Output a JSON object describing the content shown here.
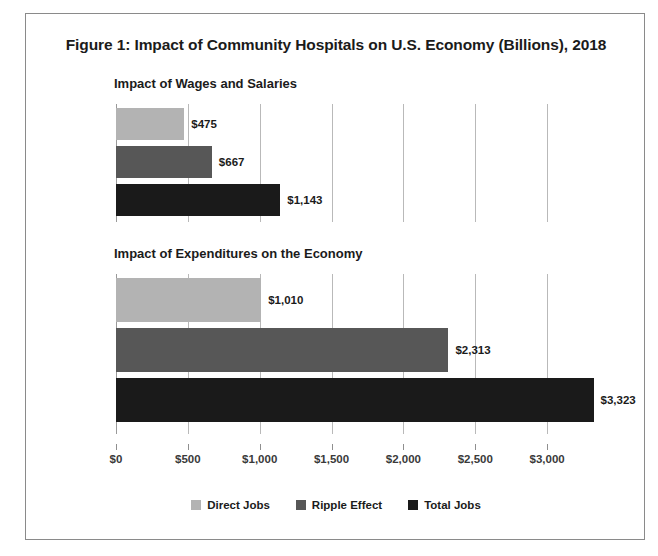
{
  "figure": {
    "title": "Figure 1: Impact of Community Hospitals on U.S. Economy (Billions), 2018"
  },
  "legend": {
    "items": [
      {
        "label": "Direct Jobs",
        "color": "#b3b3b3"
      },
      {
        "label": "Ripple Effect",
        "color": "#575757"
      },
      {
        "label": "Total Jobs",
        "color": "#1a1a1a"
      }
    ]
  },
  "axis": {
    "tick_labels": [
      "$0",
      "$500",
      "$1,000",
      "$1,500",
      "$2,000",
      "$2,500",
      "$3,000"
    ],
    "tick_values": [
      0,
      500,
      1000,
      1500,
      2000,
      2500,
      3000
    ]
  },
  "panels": [
    {
      "subtitle": "Impact of Wages and Salaries",
      "bars": [
        {
          "series": "Direct Jobs",
          "value": 475,
          "label": "$475",
          "color": "#b3b3b3"
        },
        {
          "series": "Ripple Effect",
          "value": 667,
          "label": "$667",
          "color": "#575757"
        },
        {
          "series": "Total Jobs",
          "value": 1143,
          "label": "$1,143",
          "color": "#1a1a1a"
        }
      ]
    },
    {
      "subtitle": "Impact of Expenditures on the Economy",
      "bars": [
        {
          "series": "Direct Jobs",
          "value": 1010,
          "label": "$1,010",
          "color": "#b3b3b3"
        },
        {
          "series": "Ripple Effect",
          "value": 2313,
          "label": "$2,313",
          "color": "#575757"
        },
        {
          "series": "Total Jobs",
          "value": 3323,
          "label": "$3,323",
          "color": "#1a1a1a"
        }
      ]
    }
  ],
  "chart_data": {
    "type": "bar",
    "title": "Figure 1: Impact of Community Hospitals on U.S. Economy (Billions), 2018",
    "orientation": "horizontal",
    "xlabel": "",
    "ylabel": "",
    "xlim": [
      0,
      3500
    ],
    "xticks": [
      0,
      500,
      1000,
      1500,
      2000,
      2500,
      3000
    ],
    "xtick_labels": [
      "$0",
      "$500",
      "$1,000",
      "$1,500",
      "$2,000",
      "$2,500",
      "$3,000"
    ],
    "grid": true,
    "legend_position": "bottom",
    "units": "Billions of U.S. dollars",
    "panels": [
      {
        "subtitle": "Impact of Wages and Salaries",
        "categories": [
          "Direct Jobs",
          "Ripple Effect",
          "Total Jobs"
        ],
        "values": [
          475,
          667,
          1143
        ],
        "data_labels": [
          "$475",
          "$667",
          "$1,143"
        ]
      },
      {
        "subtitle": "Impact of Expenditures on the Economy",
        "categories": [
          "Direct Jobs",
          "Ripple Effect",
          "Total Jobs"
        ],
        "values": [
          1010,
          2313,
          3323
        ],
        "data_labels": [
          "$1,010",
          "$2,313",
          "$3,323"
        ]
      }
    ],
    "series": [
      {
        "name": "Direct Jobs",
        "values": [
          475,
          1010
        ],
        "color": "#b3b3b3"
      },
      {
        "name": "Ripple Effect",
        "values": [
          667,
          2313
        ],
        "color": "#575757"
      },
      {
        "name": "Total Jobs",
        "values": [
          1143,
          3323
        ],
        "color": "#1a1a1a"
      }
    ]
  }
}
